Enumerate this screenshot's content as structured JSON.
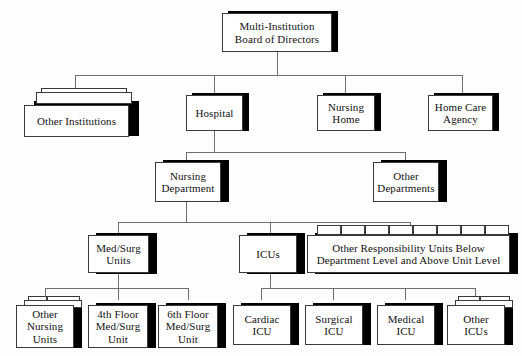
{
  "diagram": {
    "type": "org-chart",
    "background_color": "#fdfdfd",
    "box_fill_color": "#ffffff",
    "box_border_color": "#3a3a3a",
    "shadow_color": "#000000",
    "connector_color": "#6e6e6e",
    "levels": 5
  },
  "nodes": {
    "board": {
      "label": "Multi-Institution\nBoard of Directors",
      "level": 1,
      "multiple": false
    },
    "other_institutions": {
      "label": "Other Institutions",
      "level": 2,
      "multiple": true
    },
    "hospital": {
      "label": "Hospital",
      "level": 2,
      "multiple": false
    },
    "nursing_home": {
      "label": "Nursing\nHome",
      "level": 2,
      "multiple": false
    },
    "home_care_agency": {
      "label": "Home Care\nAgency",
      "level": 2,
      "multiple": false
    },
    "nursing_department": {
      "label": "Nursing\nDepartment",
      "level": 3,
      "multiple": false
    },
    "other_departments": {
      "label": "Other\nDepartments",
      "level": 3,
      "multiple": false
    },
    "med_surg_units": {
      "label": "Med/Surg\nUnits",
      "level": 4,
      "multiple": false
    },
    "icus": {
      "label": "ICUs",
      "level": 4,
      "multiple": false
    },
    "other_responsibility_units": {
      "label": "Other Responsibility Units Below\nDepartment Level and Above Unit Level",
      "level": 4,
      "multiple": true
    },
    "other_nursing_units": {
      "label": "Other\nNursing\nUnits",
      "level": 5,
      "multiple": true
    },
    "fourth_floor_med_surg": {
      "label": "4th Floor\nMed/Surg\nUnit",
      "level": 5,
      "multiple": false
    },
    "sixth_floor_med_surg": {
      "label": "6th Floor\nMed/Surg\nUnit",
      "level": 5,
      "multiple": false
    },
    "cardiac_icu": {
      "label": "Cardiac\nICU",
      "level": 5,
      "multiple": false
    },
    "surgical_icu": {
      "label": "Surgical\nICU",
      "level": 5,
      "multiple": false
    },
    "medical_icu": {
      "label": "Medical\nICU",
      "level": 5,
      "multiple": false
    },
    "other_icus": {
      "label": "Other\nICUs",
      "level": 5,
      "multiple": true
    }
  },
  "edges": [
    {
      "from": "board",
      "to": "other_institutions"
    },
    {
      "from": "board",
      "to": "hospital"
    },
    {
      "from": "board",
      "to": "nursing_home"
    },
    {
      "from": "board",
      "to": "home_care_agency"
    },
    {
      "from": "hospital",
      "to": "nursing_department"
    },
    {
      "from": "hospital",
      "to": "other_departments"
    },
    {
      "from": "nursing_department",
      "to": "med_surg_units"
    },
    {
      "from": "nursing_department",
      "to": "icus"
    },
    {
      "from": "nursing_department",
      "to": "other_responsibility_units"
    },
    {
      "from": "med_surg_units",
      "to": "other_nursing_units"
    },
    {
      "from": "med_surg_units",
      "to": "fourth_floor_med_surg"
    },
    {
      "from": "med_surg_units",
      "to": "sixth_floor_med_surg"
    },
    {
      "from": "icus",
      "to": "cardiac_icu"
    },
    {
      "from": "icus",
      "to": "surgical_icu"
    },
    {
      "from": "icus",
      "to": "medical_icu"
    },
    {
      "from": "icus",
      "to": "other_icus"
    }
  ]
}
